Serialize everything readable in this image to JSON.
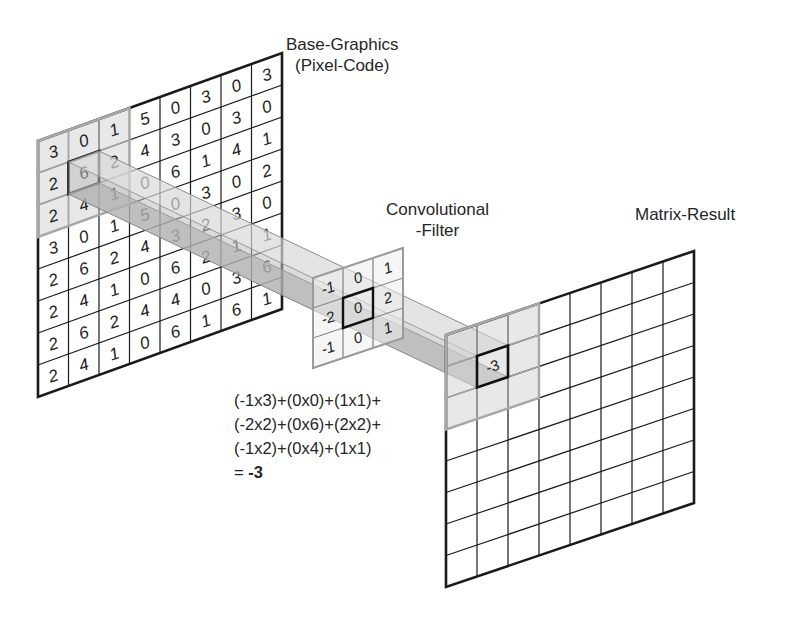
{
  "labels": {
    "base_title_line1": "Base-Graphics",
    "base_title_line2": "(Pixel-Code)",
    "filter_title_line1": "Convolutional",
    "filter_title_line2": "-Filter",
    "result_title": "Matrix-Result"
  },
  "base_matrix": {
    "rows": 8,
    "cols": 8,
    "values": [
      [
        "3",
        "0",
        "1",
        "5",
        "0",
        "3",
        "0",
        "3"
      ],
      [
        "2",
        "6",
        "2",
        "4",
        "3",
        "0",
        "3",
        "0"
      ],
      [
        "2",
        "4",
        "1",
        "0",
        "6",
        "1",
        "4",
        "1"
      ],
      [
        "3",
        "0",
        "1",
        "5",
        "0",
        "3",
        "0",
        "2"
      ],
      [
        "2",
        "6",
        "2",
        "4",
        "3",
        "2",
        "3",
        "0"
      ],
      [
        "2",
        "4",
        "1",
        "0",
        "6",
        "2",
        "1",
        "1"
      ],
      [
        "2",
        "6",
        "2",
        "4",
        "4",
        "0",
        "3",
        "6"
      ],
      [
        "2",
        "4",
        "1",
        "0",
        "6",
        "1",
        "6",
        "1"
      ]
    ],
    "highlight_window": {
      "row": 0,
      "col": 0,
      "size": 3
    },
    "center_cell": {
      "row": 1,
      "col": 1,
      "value": "6"
    }
  },
  "filter_matrix": {
    "rows": 3,
    "cols": 3,
    "values": [
      [
        "-1",
        "0",
        "1"
      ],
      [
        "-2",
        "0",
        "2"
      ],
      [
        "-1",
        "0",
        "1"
      ]
    ],
    "center_cell": {
      "row": 1,
      "col": 1,
      "value": "0"
    }
  },
  "result_matrix": {
    "rows": 8,
    "cols": 8,
    "highlight_window": {
      "row": 0,
      "col": 0,
      "size": 3
    },
    "computed_cell": {
      "row": 1,
      "col": 1,
      "value": "-3"
    }
  },
  "formula": {
    "lines": [
      "(-1x3)+(0x0)+(1x1)+",
      "(-2x2)+(0x6)+(2x2)+",
      "(-1x2)+(0x4)+(1x1)"
    ],
    "equals_prefix": "= ",
    "result": "-3"
  },
  "colors": {
    "grid_line": "#1a1a1a",
    "highlight_fill": "#d6d6d6",
    "highlight_edge": "#a8a8a8",
    "beam_light": "#d9d9d9",
    "beam_dark": "#9a9a9a",
    "text": "#262626"
  }
}
